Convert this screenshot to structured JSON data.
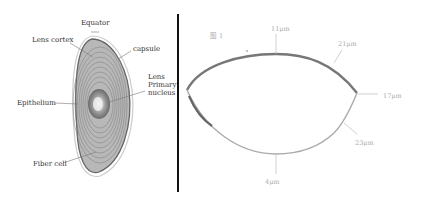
{
  "left_panel": {
    "title": "Lens anatomy",
    "labels": {
      "equator": "Equator",
      "lens_cortex": "Lens cortex",
      "capsule": "capsule",
      "lens_primary_nucleus_1": "Lens",
      "lens_primary_nucleus_2": "Primary",
      "lens_primary_nucleus_3": "nucleus",
      "epithelium": "Epithelium",
      "fiber_cell": "Fiber cell"
    }
  },
  "right_panel": {
    "corner_label": "图 1",
    "thickness_labels": {
      "top": "11μm",
      "upper_right": "21μm",
      "right": "17μm",
      "lower_right": "23μm",
      "bottom": "4μm"
    }
  },
  "divider": {
    "color": "#111111"
  }
}
